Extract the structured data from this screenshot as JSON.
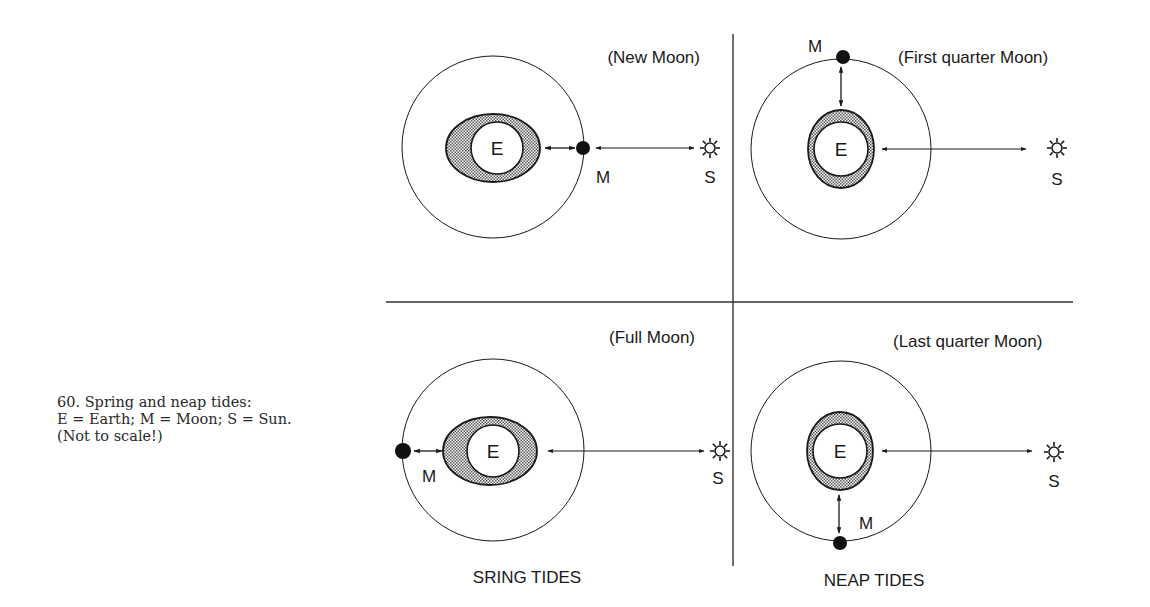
{
  "caption": {
    "lines": [
      "60. Spring and neap tides:",
      "E = Earth; M = Moon; S = Sun.",
      "(Not to scale!)"
    ]
  },
  "labels": {
    "earth": "E",
    "moon": "M",
    "sun": "S"
  },
  "panels": [
    {
      "id": "new-moon",
      "title": "(New Moon)",
      "moon_position": "between-earth-and-sun",
      "bulge": "aligned"
    },
    {
      "id": "first-quarter",
      "title": "(First quarter Moon)",
      "moon_position": "top",
      "bulge": "perpendicular"
    },
    {
      "id": "full-moon",
      "title": "(Full Moon)",
      "moon_position": "opposite-sun",
      "bulge": "aligned"
    },
    {
      "id": "last-quarter",
      "title": "(Last quarter Moon)",
      "moon_position": "bottom",
      "bulge": "perpendicular"
    }
  ],
  "group_labels": {
    "spring": "SRING TIDES",
    "neap": "NEAP TIDES"
  },
  "colors": {
    "line": "#1a1a1a",
    "stipple": "#8a8a8a",
    "background": "#ffffff"
  }
}
